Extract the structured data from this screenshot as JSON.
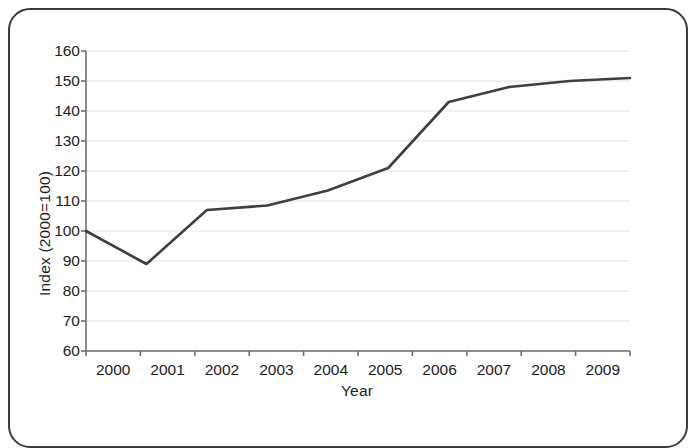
{
  "chart_data": {
    "type": "line",
    "title": "",
    "subtitle": "",
    "xlabel": "Year",
    "ylabel": "Index (2000=100)",
    "categories": [
      "2000",
      "2001",
      "2002",
      "2003",
      "2004",
      "2005",
      "2006",
      "2007",
      "2008",
      "2009"
    ],
    "x": [
      2000,
      2001,
      2002,
      2003,
      2004,
      2005,
      2006,
      2007,
      2008,
      2009
    ],
    "values": [
      100,
      89,
      107,
      108.5,
      113.5,
      121,
      143,
      148,
      150,
      151
    ],
    "series": [
      {
        "name": "Index",
        "values": [
          100,
          89,
          107,
          108.5,
          113.5,
          121,
          143,
          148,
          150,
          151
        ]
      }
    ],
    "xlim": [
      2000,
      2009
    ],
    "ylim": [
      60,
      160
    ],
    "ytick_labels": [
      "160",
      "150",
      "140",
      "130",
      "120",
      "110",
      "100",
      "90",
      "80",
      "70",
      "60"
    ],
    "yticks": [
      160,
      150,
      140,
      130,
      120,
      110,
      100,
      90,
      80,
      70,
      60
    ],
    "ytick_step": 10,
    "xtick_labels": [
      "2000",
      "2001",
      "2002",
      "2003",
      "2004",
      "2005",
      "2006",
      "2007",
      "2008",
      "2009"
    ],
    "grid": "horizontal",
    "legend": "none",
    "annotations": [],
    "colors": {
      "line": "#3f3f3f",
      "grid": "#e4e4e8",
      "axis": "#6e6e6e",
      "text": "#1d1d1d",
      "frame": "#3a3a3a",
      "background": "#ffffff"
    }
  }
}
